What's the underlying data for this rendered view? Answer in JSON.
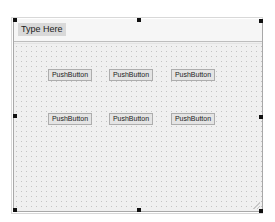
{
  "menubar": {
    "placeholder_item": "Type Here"
  },
  "buttons": [
    {
      "label": "PushButton"
    },
    {
      "label": "PushButton"
    },
    {
      "label": "PushButton"
    },
    {
      "label": "PushButton"
    },
    {
      "label": "PushButton"
    },
    {
      "label": "PushButton"
    }
  ],
  "colors": {
    "form_background": "#f0f0f0",
    "grid_dot": "#c4c4c4",
    "button_background": "#e4e4e4",
    "selection_handle": "#111111"
  }
}
